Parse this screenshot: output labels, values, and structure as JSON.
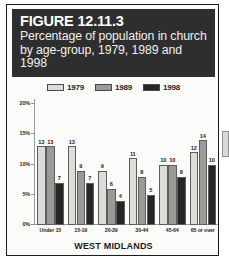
{
  "figure": {
    "number": "FIGURE 12.11.3",
    "caption": "Percentage of population in church by age-group, 1979, 1989 and 1998",
    "footer": "WEST MIDLANDS"
  },
  "colors": {
    "header_background": "#2e2e2e",
    "header_text": "#ffffff",
    "series_1979": "#dcdcd8",
    "series_1989": "#9a9a96",
    "series_1998": "#262626",
    "card_background": "#fbfbf9",
    "border": "#1b1b1b"
  },
  "chart_data": {
    "type": "bar",
    "title": "Percentage of population in church by age-group, 1979, 1989 and 1998",
    "xlabel": "WEST MIDLANDS",
    "ylabel": "",
    "categories": [
      "Under 15",
      "15-19",
      "20-29",
      "30-44",
      "45-64",
      "65 or over"
    ],
    "series": [
      {
        "name": "1979",
        "color": "#dcdcd8",
        "values": [
          13,
          13,
          9,
          11,
          10,
          12
        ]
      },
      {
        "name": "1989",
        "color": "#9a9a96",
        "values": [
          13,
          9,
          6,
          8,
          10,
          14
        ]
      },
      {
        "name": "1998",
        "color": "#262626",
        "values": [
          7,
          7,
          4,
          5,
          8,
          10
        ]
      }
    ],
    "ylim": [
      0,
      20
    ],
    "yticks": [
      0,
      5,
      10,
      15,
      20
    ],
    "ytick_labels": [
      "0%",
      "5%",
      "10%",
      "15%",
      "20%"
    ],
    "grid": false,
    "legend_position": "top-center",
    "value_labels": true
  }
}
